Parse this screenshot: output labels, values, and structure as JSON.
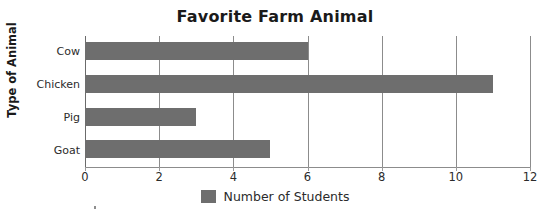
{
  "chart_data": {
    "type": "bar",
    "orientation": "horizontal",
    "title": "Favorite Farm Animal",
    "xlabel": "",
    "ylabel": "Type of Animal",
    "categories": [
      "Cow",
      "Chicken",
      "Pig",
      "Goat"
    ],
    "values": [
      6,
      11,
      3,
      5
    ],
    "series": [
      {
        "name": "Number of Students",
        "values": [
          6,
          11,
          3,
          5
        ],
        "color": "#6e6e6e"
      }
    ],
    "xlim": [
      0,
      12
    ],
    "xticks": [
      0,
      2,
      4,
      6,
      8,
      10,
      12
    ],
    "xtick_labels": [
      "0",
      "2",
      "4",
      "6",
      "8",
      "10",
      "12"
    ],
    "grid": "vertical",
    "legend": {
      "position": "bottom-center",
      "entries": [
        {
          "label": "Number of Students",
          "color": "#6e6e6e"
        }
      ]
    },
    "colors": {
      "bar": "#6e6e6e",
      "gridline": "#8c8c8c",
      "axis": "#8c8c8c",
      "text": "#2b2b2b",
      "title_text": "#1a1a1a",
      "background": "#ffffff"
    }
  }
}
